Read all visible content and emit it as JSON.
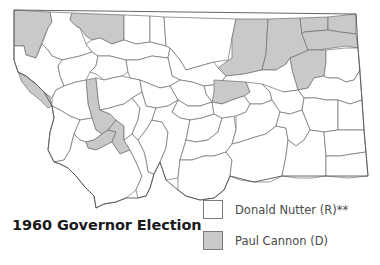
{
  "title": "1960 Governor Election",
  "legend": [
    {
      "label": "Donald Nutter (R)**",
      "color": "#ffffff",
      "party": "R"
    },
    {
      "label": "Paul Cannon (D)",
      "color": "#c9c9c9",
      "party": "D"
    }
  ],
  "colors": {
    "republican": "#ffffff",
    "democrat": "#c9c9c9",
    "border": "#6e6e6e"
  },
  "map": {
    "state": "Montana",
    "unit": "county",
    "shaded_party": "D"
  }
}
